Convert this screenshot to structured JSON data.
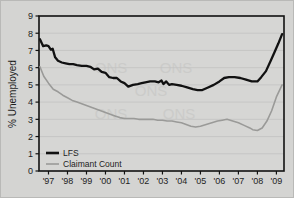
{
  "chart_data": {
    "type": "line",
    "title": "",
    "xlabel": "",
    "ylabel": "% Unemployed",
    "ylim": [
      0,
      9
    ],
    "xlim": [
      1996.5,
      2009.4
    ],
    "ytick_labels": [
      "0",
      "1",
      "2",
      "3",
      "4",
      "5",
      "6",
      "7",
      "8",
      "9"
    ],
    "ytick_values": [
      0,
      1,
      2,
      3,
      4,
      5,
      6,
      7,
      8,
      9
    ],
    "xtick_labels": [
      "'97",
      "'98",
      "'99",
      "'00",
      "'01",
      "'02",
      "'03",
      "'04",
      "'05",
      "'06",
      "'07",
      "'08",
      "'09"
    ],
    "xtick_values": [
      1997,
      1998,
      1999,
      2000,
      2001,
      2002,
      2003,
      2004,
      2005,
      2006,
      2007,
      2008,
      2009
    ],
    "grid": true,
    "grid_axis": "y",
    "legend_position": "bottom-left",
    "colors": {
      "lfs": "#111111",
      "claimant": "#9a9a98",
      "background": "#d4d4d2",
      "frame": "#111111",
      "gridline": "#c3c3c1",
      "figure_border": "#b9b9b7"
    },
    "series": [
      {
        "name": "LFS",
        "color": "#111111",
        "x": [
          1996.55,
          1996.72,
          1996.88,
          1997.0,
          1997.12,
          1997.22,
          1997.35,
          1997.5,
          1997.7,
          1997.9,
          1998.1,
          1998.3,
          1998.5,
          1998.75,
          1999.0,
          1999.2,
          1999.4,
          1999.6,
          1999.8,
          2000.0,
          2000.2,
          2000.4,
          2000.6,
          2000.8,
          2001.0,
          2001.2,
          2001.45,
          2001.7,
          2001.9,
          2002.1,
          2002.35,
          2002.6,
          2002.8,
          2002.95,
          2003.05,
          2003.2,
          2003.35,
          2003.5,
          2003.75,
          2004.0,
          2004.3,
          2004.6,
          2004.85,
          2005.1,
          2005.4,
          2005.7,
          2006.0,
          2006.25,
          2006.5,
          2006.8,
          2007.1,
          2007.4,
          2007.7,
          2008.0,
          2008.2,
          2008.45,
          2008.7,
          2008.9,
          2009.1,
          2009.3
        ],
        "y": [
          7.65,
          7.25,
          7.3,
          7.25,
          7.05,
          7.1,
          6.6,
          6.4,
          6.3,
          6.25,
          6.2,
          6.2,
          6.15,
          6.1,
          6.1,
          6.05,
          5.9,
          5.95,
          5.75,
          5.7,
          5.45,
          5.4,
          5.4,
          5.2,
          5.1,
          4.9,
          5.0,
          5.05,
          5.1,
          5.15,
          5.2,
          5.2,
          5.15,
          5.25,
          5.05,
          5.2,
          5.0,
          5.05,
          5.0,
          4.95,
          4.85,
          4.75,
          4.7,
          4.7,
          4.85,
          5.0,
          5.2,
          5.4,
          5.45,
          5.45,
          5.4,
          5.3,
          5.2,
          5.2,
          5.45,
          5.8,
          6.4,
          6.9,
          7.4,
          7.95
        ],
        "style": "solid",
        "width": 2.3
      },
      {
        "name": "Claimant Count",
        "color": "#9a9a98",
        "x": [
          1996.55,
          1996.75,
          1997.0,
          1997.25,
          1997.5,
          1997.75,
          1998.0,
          1998.25,
          1998.5,
          1998.75,
          1999.0,
          1999.25,
          1999.5,
          1999.75,
          2000.0,
          2000.25,
          2000.5,
          2000.75,
          2001.0,
          2001.25,
          2001.5,
          2001.75,
          2002.0,
          2002.25,
          2002.5,
          2002.75,
          2003.0,
          2003.25,
          2003.5,
          2003.75,
          2004.0,
          2004.25,
          2004.5,
          2004.75,
          2005.0,
          2005.3,
          2005.6,
          2005.9,
          2006.15,
          2006.4,
          2006.7,
          2007.0,
          2007.3,
          2007.6,
          2007.75,
          2008.0,
          2008.25,
          2008.5,
          2008.75,
          2009.0,
          2009.3
        ],
        "y": [
          6.05,
          5.5,
          5.1,
          4.75,
          4.6,
          4.4,
          4.25,
          4.1,
          4.0,
          3.9,
          3.8,
          3.7,
          3.6,
          3.5,
          3.4,
          3.3,
          3.2,
          3.1,
          3.05,
          3.05,
          3.05,
          3.0,
          3.0,
          3.0,
          3.0,
          2.95,
          2.95,
          2.9,
          2.9,
          2.85,
          2.8,
          2.7,
          2.6,
          2.55,
          2.6,
          2.7,
          2.8,
          2.9,
          2.95,
          3.0,
          2.9,
          2.8,
          2.65,
          2.5,
          2.4,
          2.35,
          2.5,
          2.9,
          3.5,
          4.3,
          5.0
        ],
        "style": "solid",
        "width": 1.6
      }
    ],
    "legend_entries": [
      {
        "label": "LFS",
        "color": "#111111",
        "width": 2.6
      },
      {
        "label": "Claimant Count",
        "color": "#9a9a98",
        "width": 1.6
      }
    ],
    "watermark": "ONS"
  }
}
